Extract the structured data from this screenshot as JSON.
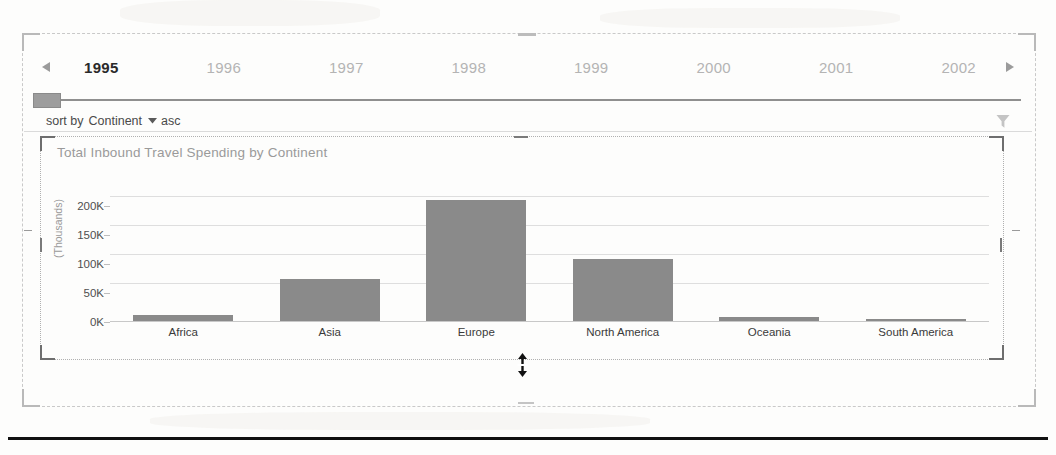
{
  "timeline": {
    "prev_label": "◀",
    "next_label": "▶",
    "prev_icon": "triangle-left-icon",
    "next_icon": "triangle-right-icon",
    "selected_year": "1995",
    "years": [
      "1995",
      "1996",
      "1997",
      "1998",
      "1999",
      "2000",
      "2001",
      "2002"
    ]
  },
  "slider": {
    "thumb_name": "slider-thumb",
    "position_percent": 0
  },
  "sortbar": {
    "prefix": "sort by",
    "field": "Continent",
    "caret_icon": "chevron-down-icon",
    "direction": "asc",
    "filter_icon": "filter-funnel-icon"
  },
  "chart_data": {
    "type": "bar",
    "title": "Total Inbound Travel Spending by Continent",
    "xlabel": "",
    "ylabel": "(Thousands)",
    "categories": [
      "Africa",
      "Asia",
      "Europe",
      "North America",
      "Oceania",
      "South America"
    ],
    "values": [
      10,
      70,
      200,
      103,
      6,
      4
    ],
    "ytick_labels": [
      "0K",
      "50K",
      "100K",
      "150K",
      "200K"
    ],
    "ytick_values": [
      0,
      50,
      100,
      150,
      200
    ],
    "ylim": [
      0,
      207
    ],
    "grid": true,
    "legend": "none",
    "bar_color": "#8a8a8a",
    "gridline_color": "#dedede"
  },
  "handles": {
    "resize_vertical_icon": "resize-vertical-cursor",
    "outer_frame_name": "report-section-selection",
    "chart_frame_name": "chart-selection-frame"
  }
}
